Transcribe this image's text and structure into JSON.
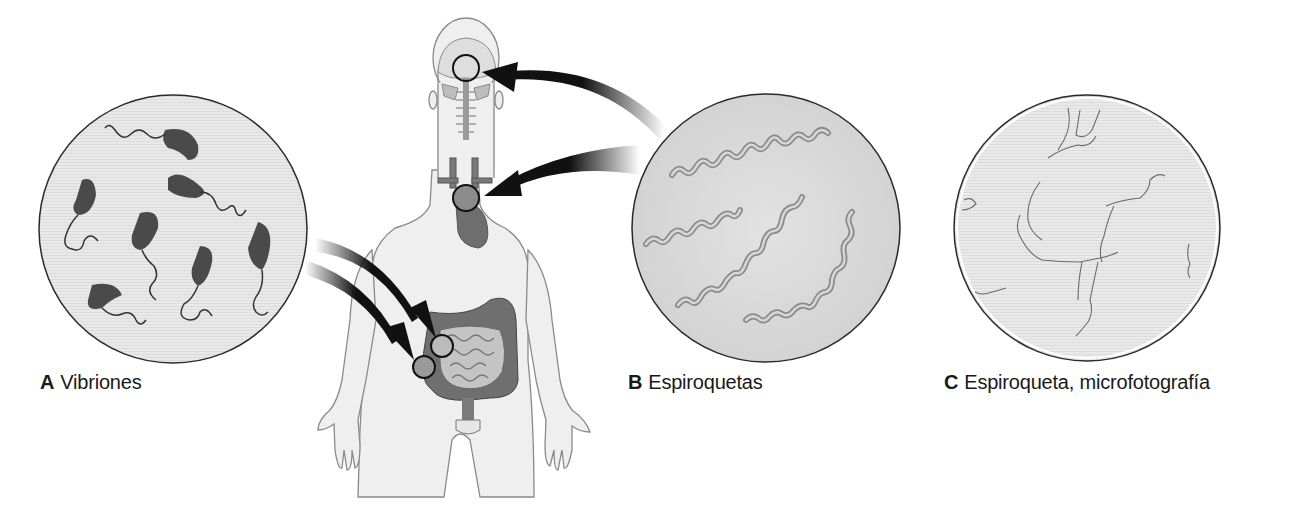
{
  "figure": {
    "panels": [
      {
        "letter": "A",
        "caption": "Vibriones"
      },
      {
        "letter": "B",
        "caption": "Espiroquetas"
      },
      {
        "letter": "C",
        "caption": "Espiroqueta, microfotografía"
      }
    ],
    "colors": {
      "circle_fill": "#e6e6e6",
      "circle_stroke": "#2a2a2a",
      "bacteria": "#4a4a4a",
      "spirochete": "#bdbdbd",
      "body_fill": "#efefef",
      "body_stroke": "#8a8a8a",
      "organ": "#7a7a7a",
      "arrow": "#111111"
    }
  }
}
